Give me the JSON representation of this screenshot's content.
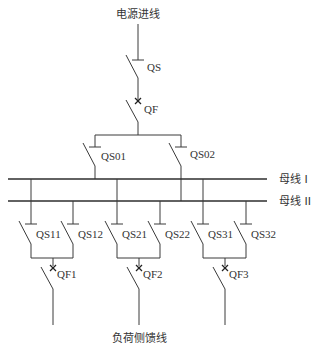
{
  "diagram": {
    "type": "single-line electrical diagram (double busbar)",
    "incoming_label": "电源进线",
    "outgoing_label": "负荷侧馈线",
    "buses": [
      {
        "id": "bus1",
        "label": "母线 I"
      },
      {
        "id": "bus2",
        "label": "母线 II"
      }
    ],
    "incoming": {
      "disconnector": "QS",
      "breaker": "QF",
      "bus_disconnectors": [
        "QS01",
        "QS02"
      ]
    },
    "feeders": [
      {
        "disconnectors": [
          "QS11",
          "QS12"
        ],
        "breaker": "QF1"
      },
      {
        "disconnectors": [
          "QS21",
          "QS22"
        ],
        "breaker": "QF2"
      },
      {
        "disconnectors": [
          "QS31",
          "QS32"
        ],
        "breaker": "QF3"
      }
    ]
  }
}
